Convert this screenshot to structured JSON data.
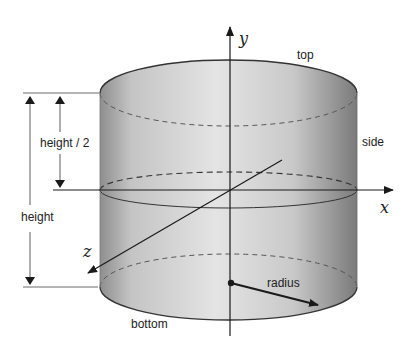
{
  "diagram": {
    "type": "cylinder-geometry",
    "labels": {
      "top": "top",
      "side": "side",
      "bottom": "bottom",
      "radius": "radius",
      "height": "height",
      "half_height": "height / 2"
    },
    "axes": {
      "x": "x",
      "y": "y",
      "z": "z"
    },
    "colors": {
      "cylinder_fill_light": "#e6e6e6",
      "cylinder_fill_dark": "#8c8c8c",
      "line": "#1a1a1a"
    }
  }
}
